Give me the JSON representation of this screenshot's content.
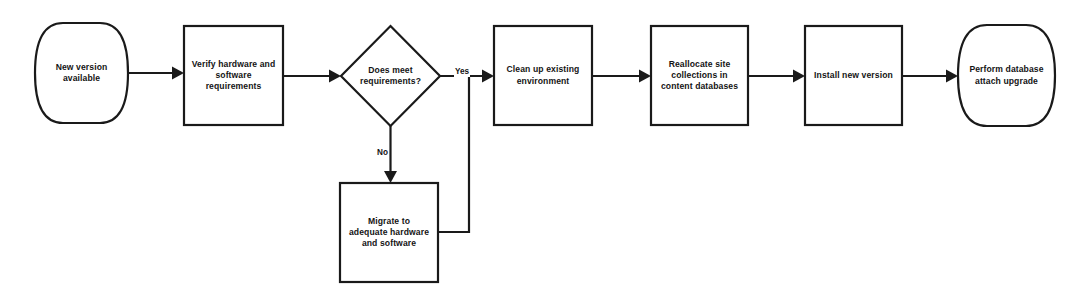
{
  "diagram": {
    "type": "flowchart",
    "background_color": "#ffffff",
    "stroke_color": "#1a1a1a",
    "text_color": "#141414",
    "nodes": [
      {
        "id": "new-version-available",
        "shape": "terminator",
        "lines": [
          "New version",
          "available"
        ],
        "x": 35,
        "y": 23,
        "w": 93,
        "h": 100
      },
      {
        "id": "verify-hardware-software-requirements",
        "shape": "process",
        "lines": [
          "Verify hardware and",
          "software",
          "requirements"
        ],
        "x": 184,
        "y": 26,
        "w": 99,
        "h": 99
      },
      {
        "id": "does-meet-requirements",
        "shape": "decision",
        "lines": [
          "Does meet",
          "requirements?"
        ],
        "x": 341,
        "y": 26,
        "w": 99,
        "h": 100
      },
      {
        "id": "clean-up-existing-environment",
        "shape": "process",
        "lines": [
          "Clean up existing",
          "environment"
        ],
        "x": 494,
        "y": 26,
        "w": 98,
        "h": 99
      },
      {
        "id": "reallocate-site-collections",
        "shape": "process",
        "lines": [
          "Reallocate site",
          "collections in",
          "content databases"
        ],
        "x": 651,
        "y": 26,
        "w": 97,
        "h": 99
      },
      {
        "id": "install-new-version",
        "shape": "process",
        "lines": [
          "Install new version"
        ],
        "x": 805,
        "y": 26,
        "w": 97,
        "h": 99
      },
      {
        "id": "perform-database-attach-upgrade",
        "shape": "terminator",
        "lines": [
          "Perform database",
          "attach upgrade"
        ],
        "x": 958,
        "y": 25,
        "w": 97,
        "h": 101
      },
      {
        "id": "migrate-to-adequate-hardware-and-software",
        "shape": "process",
        "lines": [
          "Migrate to",
          "adequate hardware",
          "and software"
        ],
        "x": 340,
        "y": 183,
        "w": 98,
        "h": 99
      }
    ],
    "edge_labels": [
      {
        "id": "yes-label",
        "text": "Yes",
        "x": 454,
        "y": 67
      },
      {
        "id": "no-label",
        "text": "No",
        "x": 376,
        "y": 148
      }
    ],
    "edges": [
      {
        "id": "edge-new-version-to-verify",
        "from": "new-version-available",
        "to": "verify-hardware-software-requirements",
        "label": ""
      },
      {
        "id": "edge-verify-to-decision",
        "from": "verify-hardware-software-requirements",
        "to": "does-meet-requirements",
        "label": ""
      },
      {
        "id": "edge-decision-yes-to-cleanup",
        "from": "does-meet-requirements",
        "to": "clean-up-existing-environment",
        "label": "Yes"
      },
      {
        "id": "edge-decision-no-to-migrate",
        "from": "does-meet-requirements",
        "to": "migrate-to-adequate-hardware-and-software",
        "label": "No"
      },
      {
        "id": "edge-migrate-to-cleanup",
        "from": "migrate-to-adequate-hardware-and-software",
        "to": "clean-up-existing-environment",
        "label": ""
      },
      {
        "id": "edge-cleanup-to-reallocate",
        "from": "clean-up-existing-environment",
        "to": "reallocate-site-collections",
        "label": ""
      },
      {
        "id": "edge-reallocate-to-install",
        "from": "reallocate-site-collections",
        "to": "install-new-version",
        "label": ""
      },
      {
        "id": "edge-install-to-perform",
        "from": "install-new-version",
        "to": "perform-database-attach-upgrade",
        "label": ""
      }
    ]
  }
}
